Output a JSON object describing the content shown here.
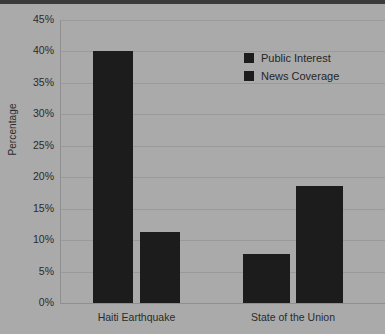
{
  "chart_data": {
    "type": "bar",
    "title": "",
    "xlabel": "",
    "ylabel": "Percentage",
    "ylim": [
      0,
      45
    ],
    "ytick_values": [
      0,
      5,
      10,
      15,
      20,
      25,
      30,
      35,
      40,
      45
    ],
    "ytick_labels": [
      "0%",
      "5%",
      "10%",
      "15%",
      "20%",
      "25%",
      "30%",
      "35%",
      "40%",
      "45%"
    ],
    "categories": [
      "Haiti Earthquake",
      "State of the Union"
    ],
    "series": [
      {
        "name": "Public Interest",
        "values": [
          40.0,
          7.8
        ],
        "color": "#1c1c1c"
      },
      {
        "name": "News Coverage",
        "values": [
          11.3,
          18.6
        ],
        "color": "#1c1c1c"
      }
    ],
    "grid": true,
    "legend_position": "upper right",
    "background_color": "#aaaaaa",
    "gridline_color": "#9a9a9a"
  },
  "legend": {
    "items": [
      {
        "label": "Public Interest"
      },
      {
        "label": "News Coverage"
      }
    ]
  },
  "axes": {
    "y_title": "Percentage"
  }
}
